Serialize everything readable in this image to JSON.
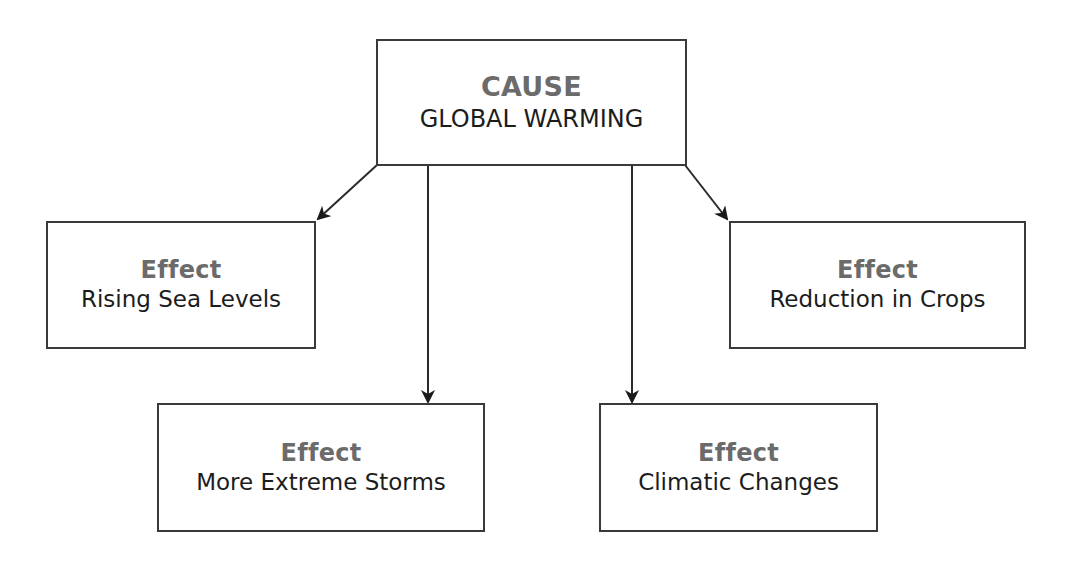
{
  "diagram": {
    "type": "cause-effect",
    "cause": {
      "heading": "CAUSE",
      "label": "GLOBAL WARMING"
    },
    "effects": [
      {
        "heading": "Effect",
        "label": "Rising Sea Levels"
      },
      {
        "heading": "Effect",
        "label": "More Extreme Storms"
      },
      {
        "heading": "Effect",
        "label": "Climatic Changes"
      },
      {
        "heading": "Effect",
        "label": "Reduction in Crops"
      }
    ],
    "colors": {
      "border": "#3a3a3a",
      "heading": "#6b6b6b",
      "text": "#1c1c1c"
    }
  }
}
